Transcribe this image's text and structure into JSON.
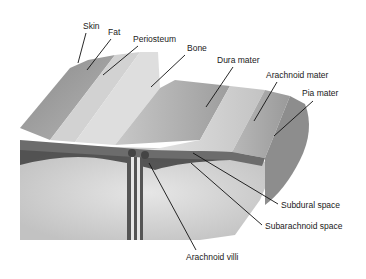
{
  "diagram": {
    "labels": [
      {
        "id": "skin",
        "text": "Skin",
        "x": 83,
        "y": 22
      },
      {
        "id": "fat",
        "text": "Fat",
        "x": 108,
        "y": 28
      },
      {
        "id": "periosteum",
        "text": "Periosteum",
        "x": 133,
        "y": 35
      },
      {
        "id": "bone",
        "text": "Bone",
        "x": 187,
        "y": 44
      },
      {
        "id": "dura-mater",
        "text": "Dura mater",
        "x": 217,
        "y": 56
      },
      {
        "id": "arachnoid-mater",
        "text": "Arachnoid mater",
        "x": 266,
        "y": 71
      },
      {
        "id": "pia-mater",
        "text": "Pia mater",
        "x": 302,
        "y": 89
      },
      {
        "id": "subdural-space",
        "text": "Subdural space",
        "x": 281,
        "y": 201
      },
      {
        "id": "subarachnoid-space",
        "text": "Subarachnoid space",
        "x": 265,
        "y": 222
      },
      {
        "id": "arachnoid-villi",
        "text": "Arachnoid villi",
        "x": 186,
        "y": 253
      }
    ],
    "leader_lines": [
      {
        "for": "skin",
        "x1": 86,
        "y1": 33,
        "x2": 78,
        "y2": 63
      },
      {
        "for": "fat",
        "x1": 111,
        "y1": 39,
        "x2": 87,
        "y2": 70
      },
      {
        "for": "periosteum",
        "x1": 138,
        "y1": 46,
        "x2": 103,
        "y2": 75
      },
      {
        "for": "bone",
        "x1": 185,
        "y1": 55,
        "x2": 151,
        "y2": 87
      },
      {
        "for": "dura-mater",
        "x1": 233,
        "y1": 67,
        "x2": 206,
        "y2": 107
      },
      {
        "for": "arachnoid-mater",
        "x1": 277,
        "y1": 82,
        "x2": 254,
        "y2": 121
      },
      {
        "for": "pia-mater",
        "x1": 313,
        "y1": 101,
        "x2": 274,
        "y2": 136
      },
      {
        "for": "subdural-space",
        "x1": 278,
        "y1": 204,
        "x2": 193,
        "y2": 153
      },
      {
        "for": "subarachnoid-space",
        "x1": 262,
        "y1": 225,
        "x2": 191,
        "y2": 163
      },
      {
        "for": "arachnoid-villi",
        "x1": 196,
        "y1": 250,
        "x2": 149,
        "y2": 163
      }
    ]
  }
}
